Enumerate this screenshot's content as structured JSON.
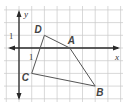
{
  "diagram": {
    "type": "coordinate-plane-polygon",
    "axes": {
      "x_label": "x",
      "y_label": "y",
      "x_tick_label": "1",
      "y_tick_label": "1"
    },
    "grid": {
      "x_range": [
        -1,
        8
      ],
      "y_range": [
        -4,
        3
      ]
    },
    "polygon": {
      "vertices": [
        {
          "label": "A",
          "x": 4,
          "y": 0
        },
        {
          "label": "B",
          "x": 6,
          "y": -3
        },
        {
          "label": "C",
          "x": 1,
          "y": -2
        },
        {
          "label": "D",
          "x": 2,
          "y": 1
        }
      ],
      "order": [
        "A",
        "B",
        "C",
        "D"
      ]
    }
  }
}
